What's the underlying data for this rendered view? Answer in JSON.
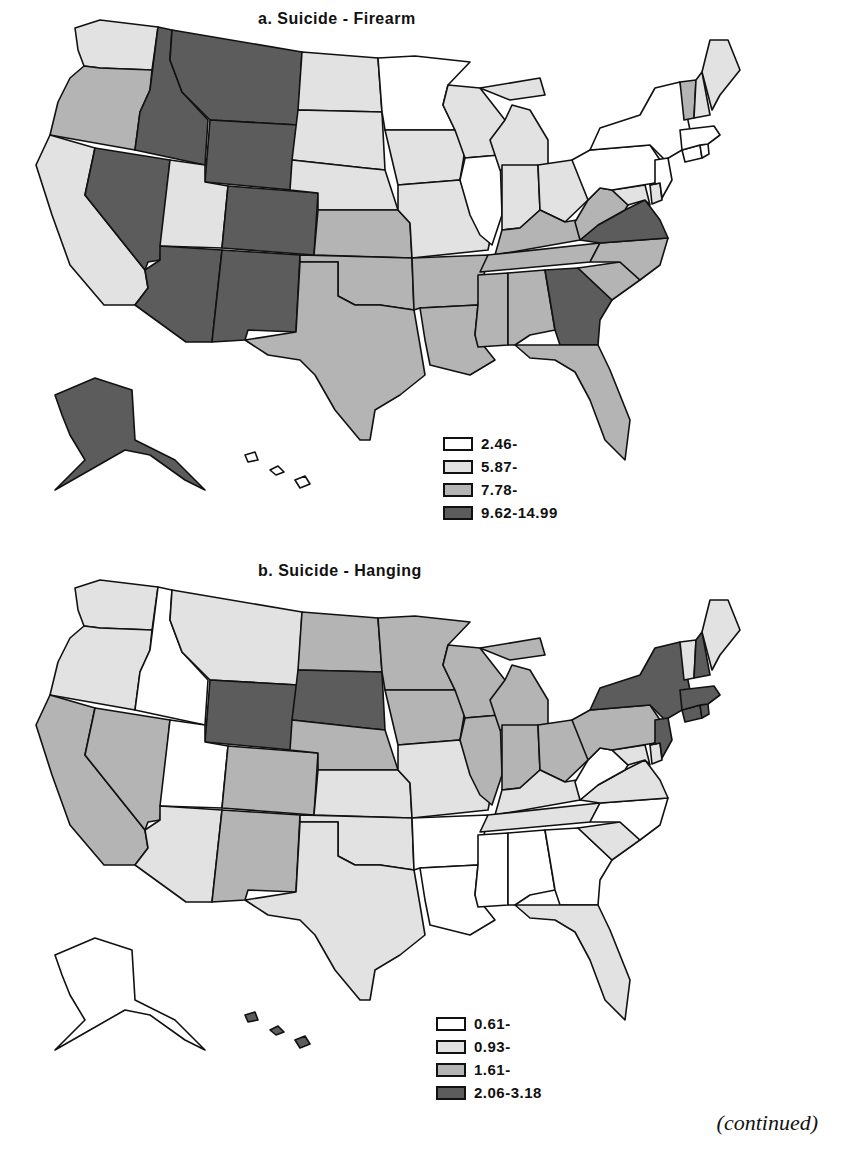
{
  "maps": [
    {
      "title": "a.   Suicide  -  Firearm",
      "legend": [
        {
          "label": "2.46-",
          "class": 0
        },
        {
          "label": "5.87-",
          "class": 1
        },
        {
          "label": "7.78-",
          "class": 2
        },
        {
          "label": "9.62-14.99",
          "class": 3
        }
      ],
      "states": {
        "WA": 1,
        "OR": 2,
        "CA": 1,
        "ID": 3,
        "NV": 3,
        "MT": 3,
        "WY": 3,
        "UT": 1,
        "CO": 3,
        "AZ": 3,
        "NM": 3,
        "ND": 1,
        "SD": 1,
        "NE": 1,
        "KS": 2,
        "OK": 2,
        "TX": 2,
        "MN": 0,
        "IA": 1,
        "MO": 1,
        "AR": 2,
        "LA": 2,
        "WI": 1,
        "IL": 0,
        "MI": 1,
        "IN": 1,
        "OH": 1,
        "KY": 2,
        "TN": 2,
        "MS": 2,
        "AL": 2,
        "GA": 3,
        "FL": 2,
        "SC": 2,
        "NC": 2,
        "VA": 3,
        "WV": 2,
        "MD": 1,
        "DE": 1,
        "PA": 0,
        "NY": 0,
        "NJ": 0,
        "CT": 0,
        "RI": 0,
        "MA": 0,
        "VT": 2,
        "NH": 1,
        "ME": 1,
        "AK": 3,
        "HI": 0
      }
    },
    {
      "title": "b.   Suicide  -  Hanging",
      "legend": [
        {
          "label": "0.61-",
          "class": 0
        },
        {
          "label": "0.93-",
          "class": 1
        },
        {
          "label": "1.61-",
          "class": 2
        },
        {
          "label": "2.06-3.18",
          "class": 3
        }
      ],
      "states": {
        "WA": 1,
        "OR": 1,
        "CA": 2,
        "ID": 0,
        "NV": 2,
        "MT": 1,
        "WY": 3,
        "UT": 0,
        "CO": 2,
        "AZ": 1,
        "NM": 2,
        "ND": 2,
        "SD": 3,
        "NE": 2,
        "KS": 1,
        "OK": 1,
        "TX": 1,
        "MN": 2,
        "IA": 2,
        "MO": 1,
        "AR": 0,
        "LA": 0,
        "WI": 2,
        "IL": 2,
        "MI": 2,
        "IN": 2,
        "OH": 2,
        "KY": 1,
        "TN": 1,
        "MS": 0,
        "AL": 0,
        "GA": 0,
        "FL": 1,
        "SC": 1,
        "NC": 0,
        "VA": 1,
        "WV": 0,
        "MD": 1,
        "DE": 1,
        "PA": 2,
        "NY": 3,
        "NJ": 3,
        "CT": 3,
        "RI": 3,
        "MA": 3,
        "VT": 1,
        "NH": 3,
        "ME": 1,
        "AK": 0,
        "HI": 3
      }
    }
  ],
  "chart_data": [
    {
      "type": "choropleth",
      "title": "a. Suicide - Firearm",
      "legend": [
        "2.46-",
        "5.87-",
        "7.78-",
        "9.62-14.99"
      ],
      "class_breaks": [
        2.46,
        5.87,
        7.78,
        9.62,
        14.99
      ],
      "state_class": {
        "WA": 1,
        "OR": 2,
        "CA": 1,
        "ID": 3,
        "NV": 3,
        "MT": 3,
        "WY": 3,
        "UT": 1,
        "CO": 3,
        "AZ": 3,
        "NM": 3,
        "ND": 1,
        "SD": 1,
        "NE": 1,
        "KS": 2,
        "OK": 2,
        "TX": 2,
        "MN": 0,
        "IA": 1,
        "MO": 1,
        "AR": 2,
        "LA": 2,
        "WI": 1,
        "IL": 0,
        "MI": 1,
        "IN": 1,
        "OH": 1,
        "KY": 2,
        "TN": 2,
        "MS": 2,
        "AL": 2,
        "GA": 3,
        "FL": 2,
        "SC": 2,
        "NC": 2,
        "VA": 3,
        "WV": 2,
        "MD": 1,
        "DE": 1,
        "PA": 0,
        "NY": 0,
        "NJ": 0,
        "CT": 0,
        "RI": 0,
        "MA": 0,
        "VT": 2,
        "NH": 1,
        "ME": 1,
        "AK": 3,
        "HI": 0
      }
    },
    {
      "type": "choropleth",
      "title": "b. Suicide - Hanging",
      "legend": [
        "0.61-",
        "0.93-",
        "1.61-",
        "2.06-3.18"
      ],
      "class_breaks": [
        0.61,
        0.93,
        1.61,
        2.06,
        3.18
      ],
      "state_class": {
        "WA": 1,
        "OR": 1,
        "CA": 2,
        "ID": 0,
        "NV": 2,
        "MT": 1,
        "WY": 3,
        "UT": 0,
        "CO": 2,
        "AZ": 1,
        "NM": 2,
        "ND": 2,
        "SD": 3,
        "NE": 2,
        "KS": 1,
        "OK": 1,
        "TX": 1,
        "MN": 2,
        "IA": 2,
        "MO": 1,
        "AR": 0,
        "LA": 0,
        "WI": 2,
        "IL": 2,
        "MI": 2,
        "IN": 2,
        "OH": 2,
        "KY": 1,
        "TN": 1,
        "MS": 0,
        "AL": 0,
        "GA": 0,
        "FL": 1,
        "SC": 1,
        "NC": 0,
        "VA": 1,
        "WV": 0,
        "MD": 1,
        "DE": 1,
        "PA": 2,
        "NY": 3,
        "NJ": 3,
        "CT": 3,
        "RI": 3,
        "MA": 3,
        "VT": 1,
        "NH": 3,
        "ME": 1,
        "AK": 0,
        "HI": 3
      }
    }
  ],
  "footer": {
    "continued": "(continued)"
  },
  "colors": {
    "class0": "#ffffff",
    "class1": "#e2e2e2",
    "class2": "#b4b4b4",
    "class3": "#5c5c5c",
    "outline": "#111111"
  }
}
